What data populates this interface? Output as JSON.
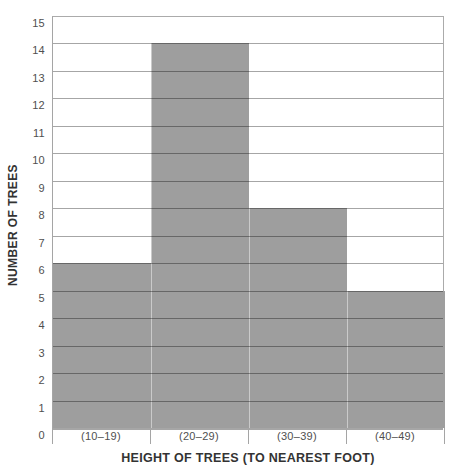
{
  "figure": {
    "background_color": "#ffffff"
  },
  "chart_data": {
    "type": "bar",
    "subtype": "histogram",
    "title": "",
    "categories": [
      "(10–19)",
      "(20–29)",
      "(30–39)",
      "(40–49)"
    ],
    "values": [
      6,
      14,
      8,
      5
    ],
    "xlabel": "HEIGHT OF TREES (TO NEAREST FOOT)",
    "ylabel": "NUMBER OF TREES",
    "ylim": [
      0,
      15
    ],
    "y_tick_step": 1,
    "y_ticks": [
      0,
      1,
      2,
      3,
      4,
      5,
      6,
      7,
      8,
      9,
      10,
      11,
      12,
      13,
      14,
      15
    ],
    "grid": "horizontal",
    "legend": "none",
    "bar_color": "#9e9e9e",
    "gridline_color": "rgba(0,0,0,0.35)",
    "frame_color": "#ababab",
    "tick_label_color": "#4f4f4f",
    "axis_title_color": "#333333"
  }
}
